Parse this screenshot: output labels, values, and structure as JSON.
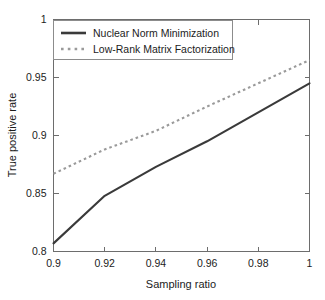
{
  "chart_data": {
    "type": "line",
    "title": "",
    "xlabel": "Sampling ratio",
    "ylabel": "True positive rate",
    "xlim": [
      0.9,
      1.0
    ],
    "ylim": [
      0.8,
      1.0
    ],
    "grid": false,
    "legend_position": "top-left",
    "xticks": [
      "0.9",
      "0.92",
      "0.94",
      "0.96",
      "0.98",
      "1"
    ],
    "xtick_values": [
      0.9,
      0.92,
      0.94,
      0.96,
      0.98,
      1.0
    ],
    "yticks": [
      "0.8",
      "0.85",
      "0.9",
      "0.95",
      "1"
    ],
    "ytick_values": [
      0.8,
      0.85,
      0.9,
      0.95,
      1.0
    ],
    "x": [
      0.9,
      0.92,
      0.94,
      0.96,
      0.98,
      1.0
    ],
    "series": [
      {
        "name": "Nuclear Norm Minimization",
        "style": "solid",
        "color": "#3a3a3a",
        "values": [
          0.807,
          0.848,
          0.873,
          0.895,
          0.92,
          0.945
        ]
      },
      {
        "name": "Low-Rank Matrix Factorization",
        "style": "dotted",
        "color": "#9a9a9a",
        "values": [
          0.867,
          0.888,
          0.904,
          0.925,
          0.945,
          0.965
        ]
      }
    ]
  },
  "axes": {
    "x_label": "Sampling ratio",
    "y_label": "True positive rate"
  },
  "legend": {
    "entries": [
      {
        "label": "Nuclear Norm Minimization"
      },
      {
        "label": "Low-Rank Matrix Factorization"
      }
    ]
  },
  "colors": {
    "series_solid": "#3a3a3a",
    "series_dotted": "#9a9a9a",
    "axis": "#6d6d6d",
    "background": "#ffffff"
  }
}
